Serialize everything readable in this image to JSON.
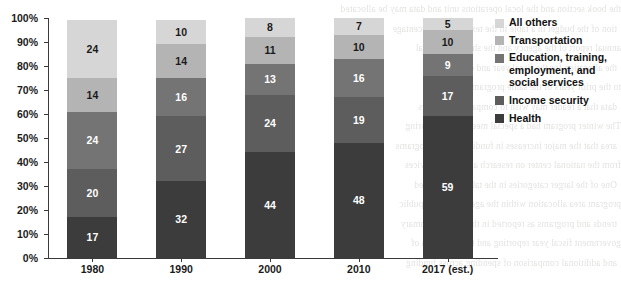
{
  "chart_data": {
    "type": "bar",
    "stacked": true,
    "orientation": "vertical",
    "title": "",
    "subtitle": "",
    "xlabel": "",
    "ylabel": "",
    "ylim": [
      0,
      100
    ],
    "y_unit": "percent",
    "grid": false,
    "legend_position": "right",
    "categories": [
      "1980",
      "1990",
      "2000",
      "2010",
      "2017 (est.)"
    ],
    "y_tick_labels": [
      "0%",
      "10%",
      "20%",
      "30%",
      "40%",
      "50%",
      "60%",
      "70%",
      "80%",
      "90%",
      "100%"
    ],
    "y_tick_values": [
      0,
      10,
      20,
      30,
      40,
      50,
      60,
      70,
      80,
      90,
      100
    ],
    "series": [
      {
        "name": "Health",
        "color": "#3c3c3c",
        "label_color": "#ffffff",
        "values": [
          17,
          32,
          44,
          48,
          59
        ]
      },
      {
        "name": "Income security",
        "color": "#5d5d5d",
        "label_color": "#ffffff",
        "values": [
          20,
          27,
          24,
          19,
          17
        ]
      },
      {
        "name": "Education, training, employment, and social services",
        "color": "#747474",
        "label_color": "#ffffff",
        "values": [
          24,
          16,
          13,
          16,
          9
        ]
      },
      {
        "name": "Transportation",
        "color": "#b4b4b4",
        "label_color": "#1a1a1a",
        "values": [
          14,
          14,
          11,
          10,
          10
        ]
      },
      {
        "name": "All others",
        "color": "#d6d6d6",
        "label_color": "#1a1a1a",
        "values": [
          24,
          10,
          8,
          7,
          5
        ]
      }
    ]
  },
  "legend": {
    "items": [
      {
        "label": "All others",
        "color": "#d6d6d6"
      },
      {
        "label": "Transportation",
        "color": "#b4b4b4"
      },
      {
        "label": "Education, training, employment, and social services",
        "color": "#747474"
      },
      {
        "label": "Income security",
        "color": "#5d5d5d"
      },
      {
        "label": "Health",
        "color": "#3c3c3c"
      }
    ]
  },
  "background_text": {
    "note": "faint show-through text from the reverse side of the scanned page",
    "lines": [
      "the book section and the local operations unit and data may be allocated",
      "tion of the budget in a table in the text and the percentage",
      "annual report of the agency and the share of the total",
      "the allocation for the fiscal year and comparisons",
      "to the prior years of the same program area",
      "data that a reader may wish to compare with others",
      "The winter program had a special meeting in the spring",
      "area that the major increases in funding for the programs",
      "from the national center on research and social services",
      "One of the larger categories in the table is described",
      "program area allocation within the agency and the public",
      "trends and programs as reported in the annual summary",
      "government fiscal year reporting and the allocation of",
      "and additional comparison of spending across funding"
    ]
  }
}
